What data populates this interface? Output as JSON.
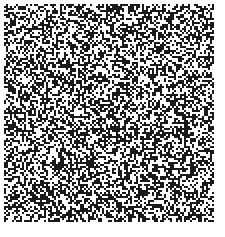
{
  "image": {
    "description": "binary random noise pattern",
    "background": "#ffffff",
    "foreground": "#1a1a1a",
    "region": {
      "x": 4,
      "y": 4,
      "width": 210,
      "height": 218
    },
    "cell_size": 2,
    "fill_ratio": 0.5
  }
}
